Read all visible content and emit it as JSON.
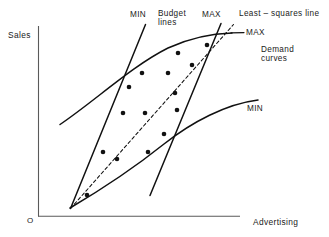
{
  "chart_data": {
    "type": "scatter",
    "title": "",
    "xlabel": "Advertising",
    "ylabel": "Sales",
    "origin_label": "O",
    "grid": false,
    "axes_shown": [
      "x",
      "y"
    ],
    "xlim": [
      0,
      100
    ],
    "ylim": [
      0,
      100
    ],
    "x_ticks": [],
    "y_ticks": [],
    "annotations": [
      {
        "id": "budget-min-label",
        "text": "MIN",
        "x": 131,
        "y": 11
      },
      {
        "id": "budget-lines-label",
        "text": "Budget\nlines",
        "x": 158,
        "y": 11
      },
      {
        "id": "budget-max-label",
        "text": "MAX",
        "x": 203,
        "y": 11
      },
      {
        "id": "least-squares-label",
        "text": "Least – squares line",
        "x": 240,
        "y": 10
      },
      {
        "id": "demand-max-label",
        "text": "MAX",
        "x": 247,
        "y": 29
      },
      {
        "id": "demand-curves-label",
        "text": "Demand\ncurves",
        "x": 262,
        "y": 46
      },
      {
        "id": "demand-min-label",
        "text": "MIN",
        "x": 248,
        "y": 105
      }
    ],
    "series": [
      {
        "name": "Observations",
        "marker": "filled-circle",
        "color": "#111111",
        "points": [
          [
            87,
            195
          ],
          [
            103,
            152
          ],
          [
            117,
            159
          ],
          [
            123,
            113
          ],
          [
            129,
            87
          ],
          [
            142,
            73
          ],
          [
            145,
            113
          ],
          [
            148,
            152
          ],
          [
            164,
            134
          ],
          [
            168,
            73
          ],
          [
            175,
            93
          ],
          [
            177,
            110
          ],
          [
            178,
            53
          ],
          [
            192,
            65
          ],
          [
            207,
            45
          ]
        ]
      }
    ],
    "curves": [
      {
        "name": "Demand curve MAX",
        "style": "solid",
        "label": "MAX"
      },
      {
        "name": "Demand curve MIN",
        "style": "solid",
        "label": "MIN"
      },
      {
        "name": "Budget line MIN",
        "style": "solid",
        "label": "MIN"
      },
      {
        "name": "Budget line MAX",
        "style": "solid",
        "label": "MAX"
      },
      {
        "name": "Least-squares line",
        "style": "dashed",
        "label": "Least – squares line"
      }
    ],
    "colors": {
      "ink": "#111111",
      "axis": "#555555",
      "background": "#ffffff"
    }
  },
  "axes": {
    "y_label": "Sales",
    "x_label": "Advertising",
    "origin": "O"
  },
  "labels": {
    "budget_min": "MIN",
    "budget_lines": "Budget",
    "budget_lines2": "lines",
    "budget_max": "MAX",
    "least_squares": "Least – squares line",
    "demand_max": "MAX",
    "demand_curves": "Demand",
    "demand_curves2": "curves",
    "demand_min": "MIN"
  }
}
